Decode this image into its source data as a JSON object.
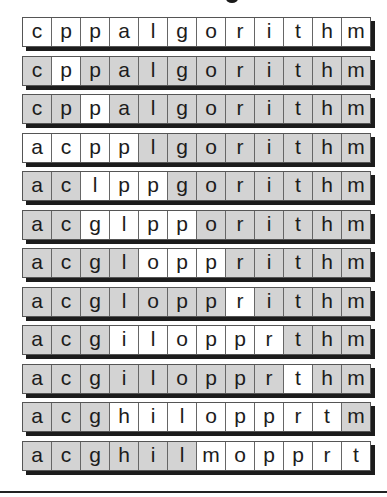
{
  "figure": {
    "title_fragment": "",
    "colors": {
      "highlight": "#ffffff",
      "shaded": "#d3d3d3",
      "border": "#555555",
      "shadow": "#1c1c1c"
    },
    "rows": [
      {
        "letters": [
          "c",
          "p",
          "p",
          "a",
          "l",
          "g",
          "o",
          "r",
          "i",
          "t",
          "h",
          "m"
        ],
        "white": [
          0,
          1,
          2,
          3,
          4,
          5,
          6,
          7,
          8,
          9,
          10,
          11
        ]
      },
      {
        "letters": [
          "c",
          "p",
          "p",
          "a",
          "l",
          "g",
          "o",
          "r",
          "i",
          "t",
          "h",
          "m"
        ],
        "white": [
          1
        ]
      },
      {
        "letters": [
          "c",
          "p",
          "p",
          "a",
          "l",
          "g",
          "o",
          "r",
          "i",
          "t",
          "h",
          "m"
        ],
        "white": [
          2
        ]
      },
      {
        "letters": [
          "a",
          "c",
          "p",
          "p",
          "l",
          "g",
          "o",
          "r",
          "i",
          "t",
          "h",
          "m"
        ],
        "white": [
          0,
          1,
          2,
          3
        ]
      },
      {
        "letters": [
          "a",
          "c",
          "l",
          "p",
          "p",
          "g",
          "o",
          "r",
          "i",
          "t",
          "h",
          "m"
        ],
        "white": [
          2,
          3,
          4
        ]
      },
      {
        "letters": [
          "a",
          "c",
          "g",
          "l",
          "p",
          "p",
          "o",
          "r",
          "i",
          "t",
          "h",
          "m"
        ],
        "white": [
          2,
          3,
          4,
          5
        ]
      },
      {
        "letters": [
          "a",
          "c",
          "g",
          "l",
          "o",
          "p",
          "p",
          "r",
          "i",
          "t",
          "h",
          "m"
        ],
        "white": [
          4,
          5,
          6
        ]
      },
      {
        "letters": [
          "a",
          "c",
          "g",
          "l",
          "o",
          "p",
          "p",
          "r",
          "i",
          "t",
          "h",
          "m"
        ],
        "white": [
          7
        ]
      },
      {
        "letters": [
          "a",
          "c",
          "g",
          "i",
          "l",
          "o",
          "p",
          "p",
          "r",
          "t",
          "h",
          "m"
        ],
        "white": [
          3,
          4,
          5,
          6,
          7,
          8
        ]
      },
      {
        "letters": [
          "a",
          "c",
          "g",
          "i",
          "l",
          "o",
          "p",
          "p",
          "r",
          "t",
          "h",
          "m"
        ],
        "white": [
          9
        ]
      },
      {
        "letters": [
          "a",
          "c",
          "g",
          "h",
          "i",
          "l",
          "o",
          "p",
          "p",
          "r",
          "t",
          "m"
        ],
        "white": [
          3,
          4,
          5,
          6,
          7,
          8,
          9,
          10
        ]
      },
      {
        "letters": [
          "a",
          "c",
          "g",
          "h",
          "i",
          "l",
          "m",
          "o",
          "p",
          "p",
          "r",
          "t"
        ],
        "white": [
          6,
          7,
          8,
          9,
          10,
          11
        ]
      }
    ]
  }
}
